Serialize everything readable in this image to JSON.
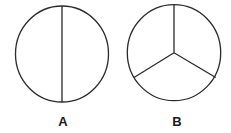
{
  "figures": [
    {
      "id": "A",
      "label": "A",
      "shape": "circle divided into 2 equal parts by a vertical diameter",
      "parts": 2
    },
    {
      "id": "B",
      "label": "B",
      "shape": "circle divided into 3 equal parts by three radii from the center",
      "parts": 3
    }
  ],
  "colors": {
    "stroke": "#2a2a2a",
    "background": "#ffffff",
    "label": "#1a1a1a"
  }
}
